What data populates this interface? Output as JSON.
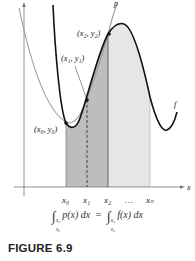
{
  "figure": {
    "axes": {
      "x_label": "x"
    },
    "curves": [
      {
        "name": "p",
        "label": "p",
        "color": "#9a9a9a",
        "description": "quadratic interpolating polynomial"
      },
      {
        "name": "f",
        "label": "f",
        "color": "#111111",
        "description": "function f"
      }
    ],
    "points": [
      {
        "label": "(x₀, y₀)"
      },
      {
        "label": "(x₁, y₁)"
      },
      {
        "label": "(x₂, y₂)"
      }
    ],
    "x_ticks": [
      "x₀",
      "x₁",
      "x₂",
      "…",
      "xₙ"
    ],
    "regions": [
      {
        "name": "x0-to-x2",
        "color": "#bdbdbd"
      },
      {
        "name": "x2-to-xn",
        "color": "#e6e6e6"
      }
    ]
  },
  "equation": {
    "left_integrand": "p(x) dx",
    "right_integrand": "f(x) dx",
    "lower": "x₀",
    "upper": "x₂",
    "equals": "="
  },
  "caption": "FIGURE 6.9"
}
